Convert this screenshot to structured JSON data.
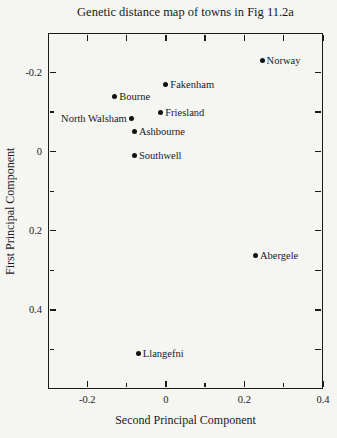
{
  "chart_data": {
    "type": "scatter",
    "title": "Genetic distance map of towns in Fig 11.2a",
    "xlabel": "Second Principal Component",
    "ylabel": "First Principal Component",
    "xlim": [
      -0.3,
      0.4
    ],
    "ylim": [
      -0.3,
      0.6
    ],
    "y_axis_direction": "increases downward (inverted)",
    "grid": false,
    "legend": "none",
    "marker": {
      "shape": "filled-circle",
      "diameter_px": 5
    },
    "colors": {
      "ink": "#1a1a1a",
      "background": "#f5f5f2"
    },
    "x_major_ticks": [
      {
        "value": -0.2,
        "label": "-0.2"
      },
      {
        "value": 0,
        "label": "0"
      },
      {
        "value": 0.2,
        "label": "0.2"
      },
      {
        "value": 0.4,
        "label": "0.4"
      }
    ],
    "x_minor_ticks": [
      -0.1,
      0.1,
      0.3
    ],
    "y_major_ticks": [
      {
        "value": -0.2,
        "label": "-0.2"
      },
      {
        "value": 0,
        "label": "0"
      },
      {
        "value": 0.2,
        "label": "0.2"
      },
      {
        "value": 0.4,
        "label": "0.4"
      }
    ],
    "y_minor_ticks": [
      -0.1,
      0.1,
      0.3,
      0.5
    ],
    "top_ticks": [
      -0.2,
      -0.1,
      0,
      0.1,
      0.2,
      0.3,
      0.4
    ],
    "right_ticks": [
      -0.2,
      -0.1,
      0,
      0.1,
      0.2,
      0.3,
      0.4,
      0.5
    ],
    "points": [
      {
        "label": "Norway",
        "x": 0.245,
        "y": -0.23,
        "label_side": "right"
      },
      {
        "label": "Fakenham",
        "x": 0.0,
        "y": -0.17,
        "label_side": "right"
      },
      {
        "label": "Bourne",
        "x": -0.13,
        "y": -0.14,
        "label_side": "right"
      },
      {
        "label": "North Walsham",
        "x": -0.088,
        "y": -0.085,
        "label_side": "left"
      },
      {
        "label": "Friesland",
        "x": -0.013,
        "y": -0.1,
        "label_side": "right"
      },
      {
        "label": "Ashbourne",
        "x": -0.08,
        "y": -0.05,
        "label_side": "right"
      },
      {
        "label": "Southwell",
        "x": -0.08,
        "y": 0.01,
        "label_side": "right"
      },
      {
        "label": "Abergele",
        "x": 0.228,
        "y": 0.263,
        "label_side": "right"
      },
      {
        "label": "Llangefni",
        "x": -0.07,
        "y": 0.51,
        "label_side": "right"
      }
    ]
  }
}
